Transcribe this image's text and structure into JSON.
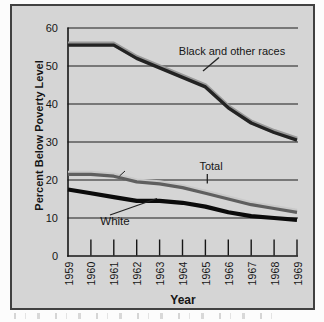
{
  "figure": {
    "y_axis_title": "Percent Below Poverty Level",
    "x_axis_title": "Year",
    "annotations": {
      "black": "Black and other races",
      "total": "Total",
      "white": "White"
    }
  },
  "colors": {
    "panel_bg": "#d5d5d5",
    "frame_border": "#414141",
    "grid": "#1c1c1c",
    "axis": "#161616",
    "text": "#151515",
    "series_black_main": "#232323",
    "series_black_highlight": "#9a9a9a",
    "series_total_main": "#5f5f5f",
    "series_total_highlight": "#c9c9c9",
    "series_white_main": "#0b0b0b",
    "leader": "#222222"
  },
  "chart_data": {
    "type": "line",
    "title": "",
    "xlabel": "Year",
    "ylabel": "Percent Below Poverty Level",
    "x": [
      1959,
      1960,
      1961,
      1962,
      1963,
      1964,
      1965,
      1966,
      1967,
      1968,
      1969
    ],
    "ylim": [
      0,
      60
    ],
    "yticks": [
      0,
      10,
      20,
      30,
      40,
      50,
      60
    ],
    "grid": true,
    "legend_position": "inline-annotations",
    "series": [
      {
        "name": "Black and other races",
        "values": [
          55.5,
          55.5,
          55.5,
          52,
          49.5,
          47,
          44.5,
          39,
          35,
          32.5,
          30.5
        ]
      },
      {
        "name": "Total",
        "values": [
          21.5,
          21.5,
          21,
          19.5,
          19,
          18,
          16.5,
          15,
          13.5,
          12.5,
          11.5
        ]
      },
      {
        "name": "White",
        "values": [
          17.5,
          16.5,
          15.5,
          14.5,
          14.5,
          14,
          13,
          11.5,
          10.5,
          10,
          9.5
        ]
      }
    ]
  }
}
